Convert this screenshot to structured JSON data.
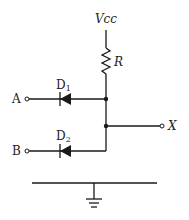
{
  "diagram": {
    "type": "diode OR/AND gate circuit",
    "supply_label": "Vcc",
    "resistor_label": "R",
    "diodes": [
      {
        "label": "D",
        "subscript": "1",
        "input_label": "A"
      },
      {
        "label": "D",
        "subscript": "2",
        "input_label": "B"
      }
    ],
    "output_label": "X",
    "ground": "ground-symbol"
  }
}
